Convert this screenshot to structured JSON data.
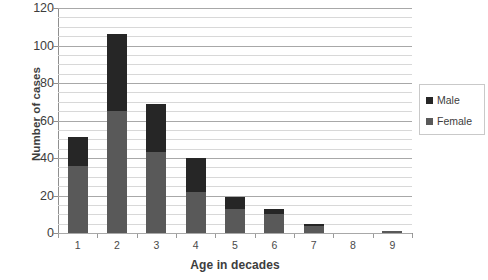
{
  "chart_data": {
    "type": "bar",
    "stacked": true,
    "title": "",
    "xlabel": "Age in decades",
    "ylabel": "Number of cases",
    "categories": [
      "1",
      "2",
      "3",
      "4",
      "5",
      "6",
      "7",
      "8",
      "9"
    ],
    "series": [
      {
        "name": "Female",
        "color": "#595959",
        "values": [
          36,
          65,
          43,
          22,
          13,
          10,
          4,
          0,
          1
        ]
      },
      {
        "name": "Male",
        "color": "#262626",
        "values": [
          15,
          41,
          26,
          18,
          6,
          3,
          1,
          0,
          0
        ]
      }
    ],
    "totals": [
      51,
      106,
      69,
      40,
      19,
      13,
      5,
      0,
      1
    ],
    "ylim": [
      0,
      120
    ],
    "ytick_values": [
      0,
      20,
      40,
      60,
      80,
      100,
      120
    ],
    "ytick_labels": [
      "0",
      "20",
      "40",
      "60",
      "80",
      "100",
      "120"
    ],
    "minor_gridline_step": 5,
    "grid": true,
    "legend_position": "right",
    "legend_entries": [
      "Male",
      "Female"
    ]
  },
  "legend": {
    "male_label": "Male",
    "female_label": "Female",
    "male_color": "#262626",
    "female_color": "#595959"
  },
  "axes": {
    "y_title": "Number of cases",
    "x_title": "Age in decades"
  }
}
